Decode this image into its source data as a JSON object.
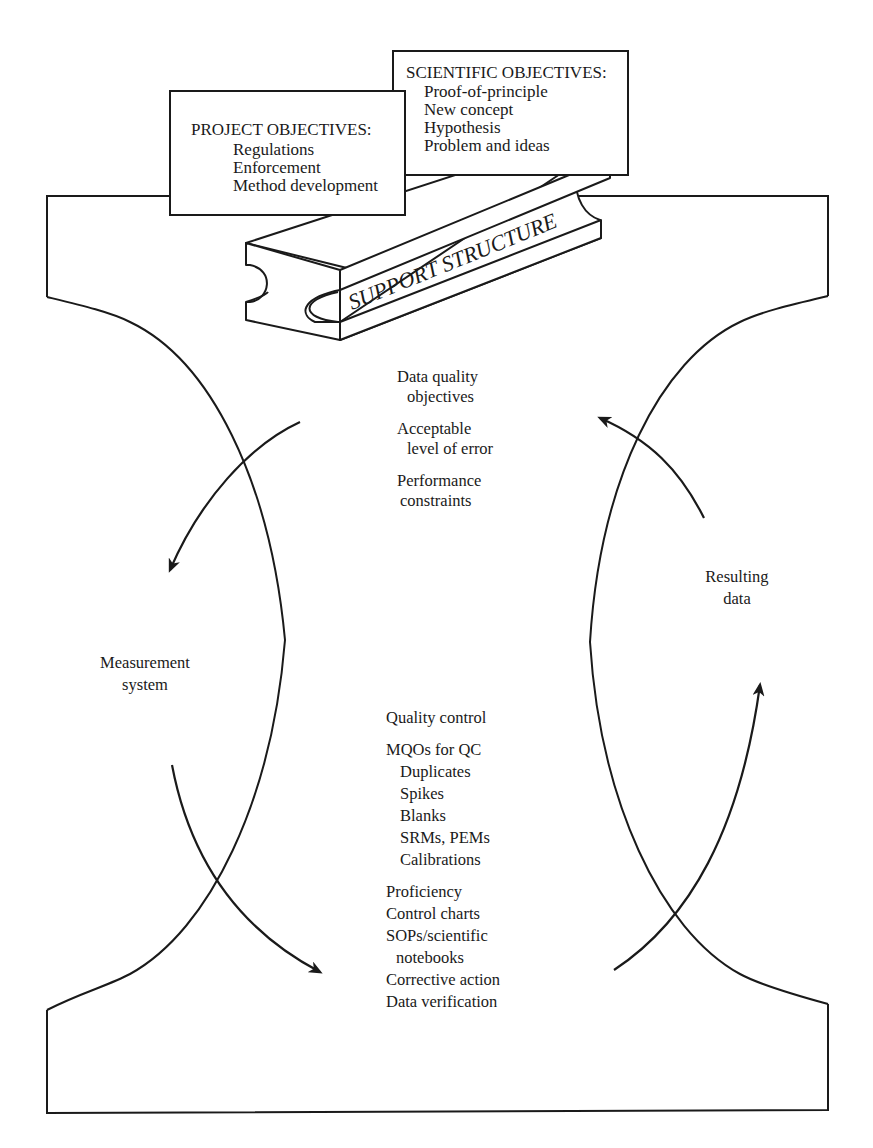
{
  "colors": {
    "ink": "#1a1a1a",
    "background": "#ffffff"
  },
  "project_objectives": {
    "heading": "PROJECT OBJECTIVES:",
    "items": [
      "Regulations",
      "Enforcement",
      "Method development"
    ]
  },
  "scientific_objectives": {
    "heading": "SCIENTIFIC OBJECTIVES:",
    "items": [
      "Proof-of-principle",
      "New concept",
      "Hypothesis",
      "Problem and ideas"
    ]
  },
  "support_beam": {
    "label": "SUPPORT STRUCTURE"
  },
  "upper_center": {
    "groups": [
      {
        "lines": [
          "Data quality",
          "objectives"
        ]
      },
      {
        "lines": [
          "Acceptable",
          "level of error"
        ]
      },
      {
        "lines": [
          "Performance",
          "constraints"
        ]
      }
    ]
  },
  "left_label": {
    "lines": [
      "Measurement",
      "system"
    ]
  },
  "right_label": {
    "lines": [
      "Resulting",
      "data"
    ]
  },
  "lower_center": {
    "quality_control": "Quality control",
    "mqos_heading": "MQOs for QC",
    "mqos_items": [
      "Duplicates",
      "Spikes",
      "Blanks",
      "SRMs, PEMs",
      "Calibrations"
    ],
    "other_items": [
      "Proficiency",
      "Control charts",
      "SOPs/scientific",
      "notebooks",
      "Corrective action",
      "Data verification"
    ]
  },
  "arrows": [
    {
      "name": "upper-left-arrow",
      "direction": "down-left"
    },
    {
      "name": "upper-right-arrow",
      "direction": "up-left"
    },
    {
      "name": "lower-left-arrow",
      "direction": "down-right"
    },
    {
      "name": "lower-right-arrow",
      "direction": "up"
    }
  ]
}
